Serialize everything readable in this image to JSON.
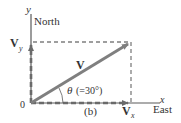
{
  "diagram": {
    "axes": {
      "y_label": "y",
      "y_direction": "North",
      "x_label": "x",
      "x_direction": "East",
      "origin_label": "0"
    },
    "vectors": {
      "resultant": {
        "symbol": "V"
      },
      "y_component": {
        "symbol": "V",
        "subscript": "y"
      },
      "x_component": {
        "symbol": "V",
        "subscript": "x"
      }
    },
    "angle": {
      "symbol": "θ",
      "value_text": "(=30°)",
      "degrees": 30
    },
    "panel_label": "(b)",
    "colors": {
      "axis": "#5a5a5a",
      "vector": "#7f7f7f",
      "dashed": "#7f7f7f",
      "text": "#333333",
      "background": "#ffffff"
    }
  }
}
